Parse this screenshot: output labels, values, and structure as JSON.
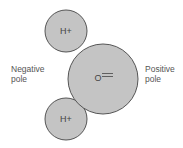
{
  "diagram": {
    "colors": {
      "atom_fill": "#c4c4c4",
      "atom_stroke": "#555555",
      "text": "#444444"
    },
    "atoms": [
      {
        "id": "hydrogen-top",
        "label": "H+",
        "cx": 66,
        "cy": 31,
        "r": 21
      },
      {
        "id": "oxygen",
        "label": "O",
        "cx": 103,
        "cy": 79,
        "r": 35
      },
      {
        "id": "hydrogen-bottom",
        "label": "H+",
        "cx": 66,
        "cy": 119,
        "r": 21
      }
    ],
    "labels": {
      "negative_line1": "Negative",
      "negative_line2": "pole",
      "positive_line1": "Positive",
      "positive_line2": "pole"
    }
  }
}
